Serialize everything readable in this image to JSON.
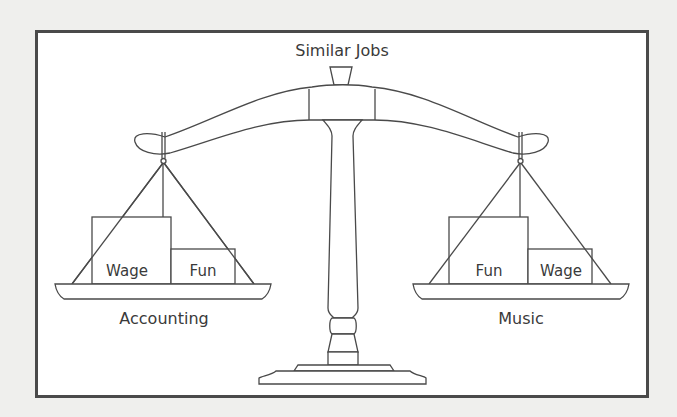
{
  "diagram": {
    "title": "Similar Jobs",
    "left_pan": {
      "label": "Accounting",
      "weights": [
        {
          "label": "Wage",
          "size": "large"
        },
        {
          "label": "Fun",
          "size": "small"
        }
      ]
    },
    "right_pan": {
      "label": "Music",
      "weights": [
        {
          "label": "Fun",
          "size": "large"
        },
        {
          "label": "Wage",
          "size": "small"
        }
      ]
    },
    "colors": {
      "background": "#efefed",
      "frame_border": "#4a4a4a",
      "line": "#4a4a4a",
      "text": "#3a3a3a"
    }
  }
}
